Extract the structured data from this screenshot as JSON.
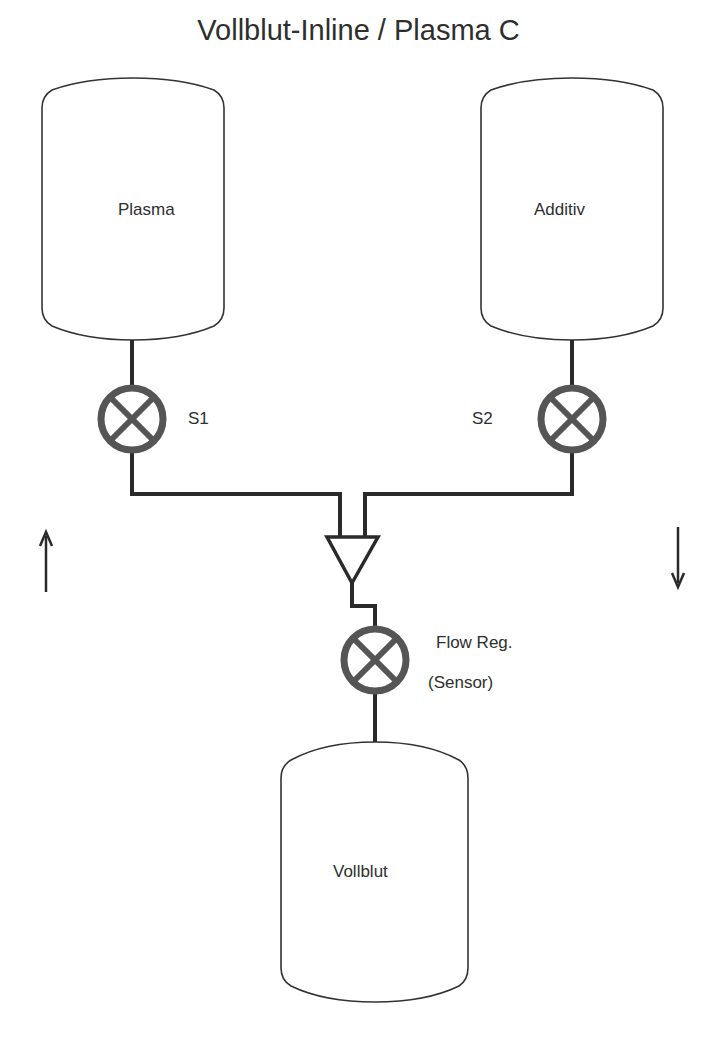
{
  "title": "Vollblut-Inline / Plasma C",
  "tanks": [
    {
      "id": "plasma",
      "label": "Plasma"
    },
    {
      "id": "additiv",
      "label": "Additiv"
    },
    {
      "id": "vollblut",
      "label": "Vollblut"
    }
  ],
  "valves": [
    {
      "id": "s1",
      "label": "S1"
    },
    {
      "id": "s2",
      "label": "S2"
    },
    {
      "id": "flow-reg",
      "label": "Flow Reg.",
      "sublabel": "(Sensor)"
    }
  ],
  "arrows": [
    {
      "id": "left",
      "direction": "up",
      "glyph": "↑"
    },
    {
      "id": "right",
      "direction": "down",
      "glyph": "↓"
    }
  ],
  "colors": {
    "line": "#2a2a2a",
    "valve": "#555555",
    "background": "#ffffff"
  }
}
